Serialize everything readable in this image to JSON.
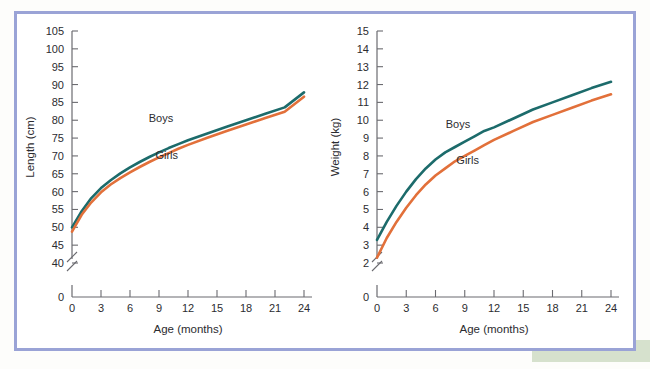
{
  "figure": {
    "frame_color": "#9aa3d6",
    "background": "#ffffff",
    "accent_green": "#cfdcc4"
  },
  "series_colors": {
    "boys": "#1c6b6b",
    "girls": "#e2703a"
  },
  "chart_data": [
    {
      "id": "length-chart",
      "type": "line",
      "title": "",
      "xlabel": "Age (months)",
      "ylabel": "Length (cm)",
      "xlim": [
        0,
        24
      ],
      "ylim": [
        40,
        105
      ],
      "y_axis_break": true,
      "y_zero_label": "0",
      "grid": false,
      "legend_position": "inline-annotation",
      "xticks": [
        0,
        3,
        6,
        9,
        12,
        15,
        18,
        21,
        24
      ],
      "xtick_labels": [
        "0",
        "3",
        "6",
        "9",
        "12",
        "15",
        "18",
        "21",
        "24"
      ],
      "yticks": [
        40,
        45,
        50,
        55,
        60,
        65,
        70,
        75,
        80,
        85,
        90,
        95,
        100,
        105
      ],
      "ytick_labels": [
        "40",
        "45",
        "50",
        "55",
        "60",
        "65",
        "70",
        "75",
        "80",
        "85",
        "90",
        "95",
        "100",
        "105"
      ],
      "x": [
        0,
        1,
        2,
        3,
        4,
        5,
        6,
        7,
        8,
        9,
        10,
        11,
        12,
        14,
        16,
        18,
        20,
        22,
        24
      ],
      "series": [
        {
          "name": "Boys",
          "color": "#1c6b6b",
          "label_x": 9.2,
          "label_y": 79.5,
          "values": [
            50.0,
            54.5,
            58.2,
            61.0,
            63.2,
            65.1,
            66.8,
            68.3,
            69.7,
            71.0,
            72.2,
            73.3,
            74.4,
            76.3,
            78.2,
            80.0,
            81.8,
            83.6,
            87.8
          ]
        },
        {
          "name": "Girls",
          "color": "#e2703a",
          "label_x": 9.8,
          "label_y": 69.0,
          "values": [
            48.8,
            53.5,
            57.0,
            59.8,
            62.0,
            63.8,
            65.4,
            66.9,
            68.3,
            69.6,
            70.8,
            72.0,
            73.1,
            75.1,
            77.0,
            78.8,
            80.6,
            82.4,
            86.6
          ]
        }
      ]
    },
    {
      "id": "weight-chart",
      "type": "line",
      "title": "",
      "xlabel": "Age (months)",
      "ylabel": "Weight (kg)",
      "xlim": [
        0,
        24
      ],
      "ylim": [
        2,
        15
      ],
      "y_axis_break": true,
      "y_zero_label": "0",
      "grid": false,
      "legend_position": "inline-annotation",
      "xticks": [
        0,
        3,
        6,
        9,
        12,
        15,
        18,
        21,
        24
      ],
      "xtick_labels": [
        "0",
        "3",
        "6",
        "9",
        "12",
        "15",
        "18",
        "21",
        "24"
      ],
      "yticks": [
        2,
        3,
        4,
        5,
        6,
        7,
        8,
        9,
        10,
        11,
        12,
        13,
        14,
        15
      ],
      "ytick_labels": [
        "2",
        "3",
        "4",
        "5",
        "6",
        "7",
        "8",
        "9",
        "10",
        "11",
        "12",
        "13",
        "14",
        "15"
      ],
      "x": [
        0,
        1,
        2,
        3,
        4,
        5,
        6,
        7,
        8,
        9,
        10,
        11,
        12,
        14,
        16,
        18,
        20,
        22,
        24
      ],
      "series": [
        {
          "name": "Boys",
          "color": "#1c6b6b",
          "label_x": 8.3,
          "label_y": 9.55,
          "values": [
            3.3,
            4.3,
            5.2,
            6.0,
            6.7,
            7.3,
            7.8,
            8.2,
            8.5,
            8.8,
            9.1,
            9.4,
            9.6,
            10.1,
            10.6,
            11.0,
            11.4,
            11.8,
            12.15
          ]
        },
        {
          "name": "Girls",
          "color": "#e2703a",
          "label_x": 9.3,
          "label_y": 7.55,
          "values": [
            2.3,
            3.4,
            4.3,
            5.1,
            5.8,
            6.4,
            6.9,
            7.3,
            7.7,
            8.0,
            8.3,
            8.6,
            8.9,
            9.4,
            9.9,
            10.3,
            10.7,
            11.1,
            11.45
          ]
        }
      ]
    }
  ]
}
